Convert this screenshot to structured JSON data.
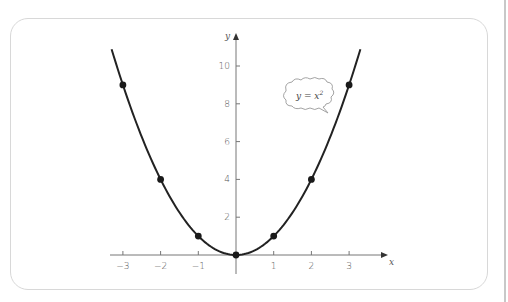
{
  "chart_data": {
    "type": "line",
    "title": "",
    "function": "y = x^2",
    "annotation": {
      "text": "y = x",
      "superscript": "2",
      "style": "cloud-callout"
    },
    "xlabel": "x",
    "ylabel": "y",
    "xlim": [
      -3.3,
      3.9
    ],
    "ylim": [
      -1,
      11.5
    ],
    "x_ticks": [
      -3,
      -2,
      -1,
      1,
      2,
      3
    ],
    "x_tick_labels": [
      "−3",
      "−2",
      "−1",
      "1",
      "2",
      "3"
    ],
    "y_ticks": [
      2,
      4,
      6,
      8,
      10
    ],
    "y_tick_labels": [
      "2",
      "4",
      "6",
      "8",
      "10"
    ],
    "grid": false,
    "legend": null,
    "points": [
      {
        "x": -3,
        "y": 9
      },
      {
        "x": -2,
        "y": 4
      },
      {
        "x": -1,
        "y": 1
      },
      {
        "x": 0,
        "y": 0
      },
      {
        "x": 1,
        "y": 1
      },
      {
        "x": 2,
        "y": 4
      },
      {
        "x": 3,
        "y": 9
      }
    ],
    "curve_range": [
      -3.3,
      3.3
    ],
    "colors": {
      "curve": "#222222",
      "points": "#1a1a1a",
      "axes": "#777777",
      "panel_border": "#d8d8d8"
    }
  }
}
